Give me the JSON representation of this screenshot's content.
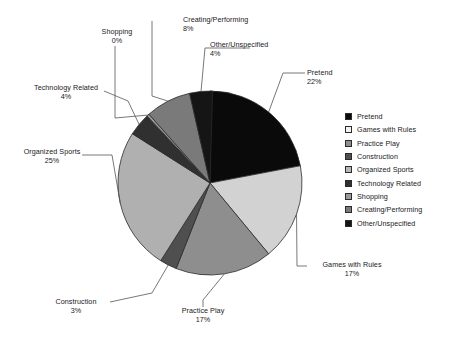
{
  "chart_data": {
    "type": "pie",
    "title": "",
    "subtitle": "",
    "xlabel": "",
    "ylabel": "",
    "legend_position": "right",
    "grid": false,
    "start_angle_deg": 0,
    "direction": "clockwise",
    "units": "percent",
    "categories": [
      "Pretend",
      "Games with Rules",
      "Practice Play",
      "Construction",
      "Organized Sports",
      "Technology Related",
      "Shopping",
      "Creating/Performing",
      "Other/Unspecified"
    ],
    "values": [
      22,
      17,
      17,
      3,
      25,
      4,
      0,
      8,
      4
    ],
    "value_labels": [
      "22%",
      "17%",
      "17%",
      "3%",
      "25%",
      "4%",
      "0%",
      "8%",
      "4%"
    ],
    "colors": [
      "#0a0a0a",
      "#d2d2d2",
      "#8e8e8e",
      "#4f4f4f",
      "#b0b0b0",
      "#303030",
      "#9a9a9a",
      "#7a7a7a",
      "#151515"
    ],
    "slices": [
      {
        "label": "Pretend",
        "value": 22,
        "value_label": "22%",
        "color": "#0a0a0a"
      },
      {
        "label": "Games with Rules",
        "value": 17,
        "value_label": "17%",
        "color": "#d2d2d2"
      },
      {
        "label": "Practice Play",
        "value": 17,
        "value_label": "17%",
        "color": "#8e8e8e"
      },
      {
        "label": "Construction",
        "value": 3,
        "value_label": "3%",
        "color": "#4f4f4f"
      },
      {
        "label": "Organized Sports",
        "value": 25,
        "value_label": "25%",
        "color": "#b0b0b0"
      },
      {
        "label": "Technology Related",
        "value": 4,
        "value_label": "4%",
        "color": "#303030"
      },
      {
        "label": "Shopping",
        "value": 0,
        "value_label": "0%",
        "color": "#9a9a9a"
      },
      {
        "label": "Creating/Performing",
        "value": 8,
        "value_label": "8%",
        "color": "#7a7a7a"
      },
      {
        "label": "Other/Unspecified",
        "value": 4,
        "value_label": "4%",
        "color": "#151515"
      }
    ]
  },
  "callouts": {
    "pretend": {
      "label": "Pretend",
      "value_label": "22%"
    },
    "games_with_rules": {
      "label": "Games with Rules",
      "value_label": "17%"
    },
    "practice_play": {
      "label": "Practice Play",
      "value_label": "17%"
    },
    "construction": {
      "label": "Construction",
      "value_label": "3%"
    },
    "organized_sports": {
      "label": "Organized Sports",
      "value_label": "25%"
    },
    "technology_related": {
      "label": "Technology Related",
      "value_label": "4%"
    },
    "shopping": {
      "label": "Shopping",
      "value_label": "0%"
    },
    "creating_performing": {
      "label": "Creating/Performing",
      "value_label": "8%"
    },
    "other_unspecified": {
      "label": "Other/Unspecified",
      "value_label": "4%"
    }
  },
  "legend": {
    "items": [
      {
        "label": "Pretend",
        "color": "#0a0a0a"
      },
      {
        "label": "Games with Rules",
        "color": "#f2f2f2"
      },
      {
        "label": "Practice Play",
        "color": "#8e8e8e"
      },
      {
        "label": "Construction",
        "color": "#4f4f4f"
      },
      {
        "label": "Organized Sports",
        "color": "#b8b8b8"
      },
      {
        "label": "Technology Related",
        "color": "#303030"
      },
      {
        "label": "Shopping",
        "color": "#9a9a9a"
      },
      {
        "label": "Creating/Performing",
        "color": "#7a7a7a"
      },
      {
        "label": "Other/Unspecified",
        "color": "#151515"
      }
    ]
  },
  "style": {
    "outline_color": "#2b2b2b",
    "leader_color": "#555555",
    "text_color": "#1a1a1a",
    "background": "#ffffff"
  },
  "geometry": {
    "center_x": 210,
    "center_y": 183,
    "radius": 92
  }
}
